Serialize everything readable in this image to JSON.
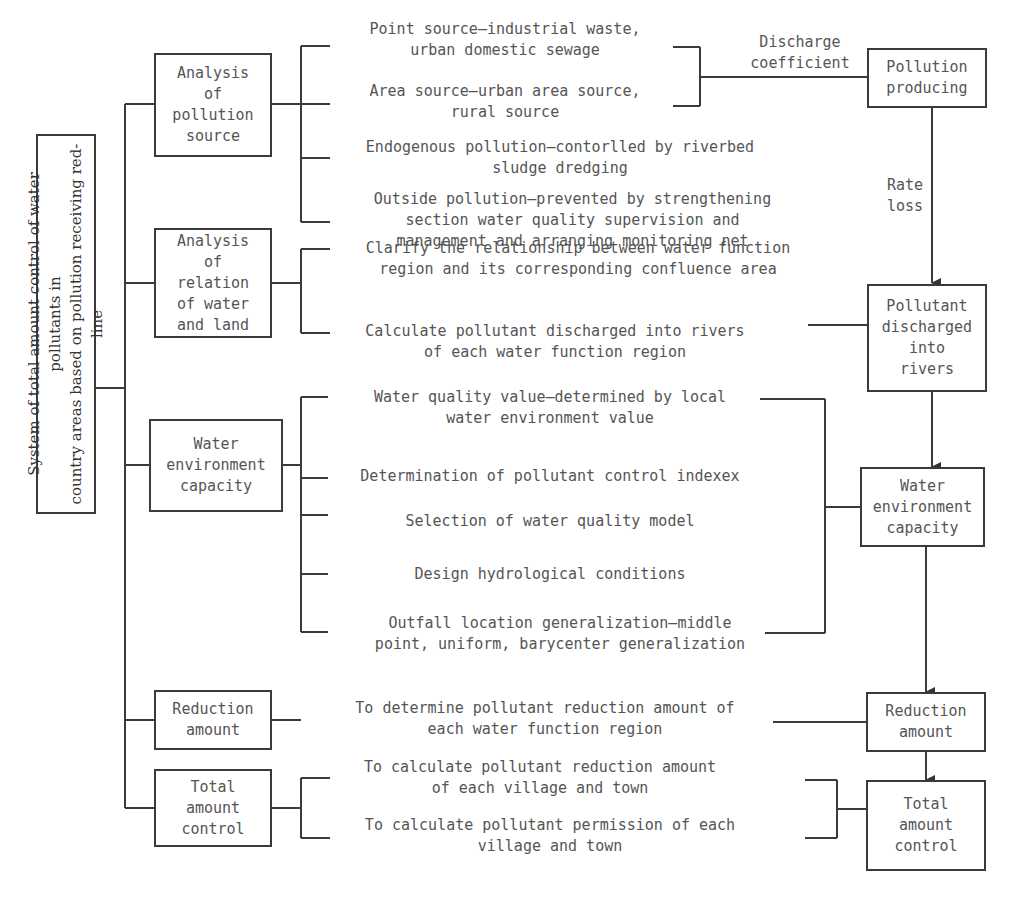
{
  "root": {
    "title": "System of total amount control of water pollutants in\ncountry areas based on pollution receiving red-line"
  },
  "categories": [
    {
      "label": "Analysis\nof\npollution\nsource"
    },
    {
      "label": "Analysis\nof\nrelation\nof water\nand land"
    },
    {
      "label": "Water\nenvironment\ncapacity"
    },
    {
      "label": "Reduction\namount"
    },
    {
      "label": "Total\namount\ncontrol"
    }
  ],
  "items": {
    "pollution_source": [
      "Point source—industrial waste,\nurban domestic sewage",
      "Area source—urban area source,\nrural source",
      "Endogenous pollution—contorlled by riverbed\nsludge dredging",
      "Outside pollution—prevented by strengthening\nsection water quality supervision and\nmanagement and arranging monitoring net"
    ],
    "water_land": [
      "Clarify the relationship between water function\nregion and its corresponding confluence area",
      "Calculate pollutant discharged into rivers\nof each water function region"
    ],
    "capacity": [
      "Water quality value—determined by local\nwater environment value",
      "Determination of pollutant control indexex",
      "Selection of water quality model",
      "Design hydrological conditions",
      "Outfall location generalization—middle\npoint, uniform, barycenter generalization"
    ],
    "reduction": [
      "To determine pollutant reduction amount of\neach water function region"
    ],
    "total_control": [
      "To calculate pollutant reduction amount\nof each village and town",
      "To calculate pollutant permission of each\nvillage and town"
    ]
  },
  "edge_labels": {
    "discharge": "Discharge\ncoefficient",
    "rate_loss": "Rate\nloss"
  },
  "flow": [
    {
      "label": "Pollution\nproducing"
    },
    {
      "label": "Pollutant\ndischarged\ninto\nrivers"
    },
    {
      "label": "Water\nenvironment\ncapacity"
    },
    {
      "label": "Reduction\namount"
    },
    {
      "label": "Total\namount\ncontrol"
    }
  ]
}
